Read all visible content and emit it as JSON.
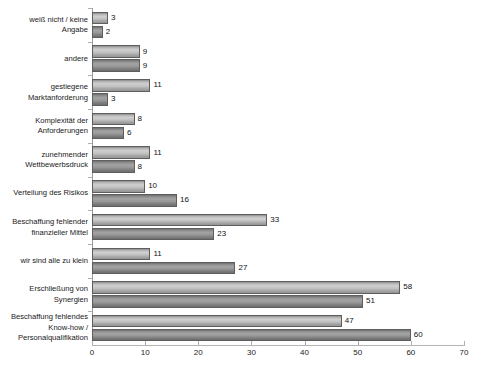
{
  "chart_data": {
    "type": "bar",
    "orientation": "horizontal",
    "title": "",
    "subtitle": "",
    "xlabel": "",
    "ylabel": "",
    "xlim": [
      0,
      70
    ],
    "xticks": [
      0,
      10,
      20,
      30,
      40,
      50,
      60,
      70
    ],
    "xtick_labels": [
      "0",
      "10",
      "20",
      "30",
      "40",
      "50",
      "60",
      "70"
    ],
    "grid": false,
    "legend": "none",
    "colors": {
      "series_0": "#c4c4c4",
      "series_1": "#8f8f8f",
      "bar_outline": "#5e5e5e",
      "axis": "#b0b0b0",
      "text": "#111111"
    },
    "categories": [
      "weiß nicht / keine\nAngabe",
      "andere",
      "gestiegene\nMarktanforderung",
      "Komplexität der\nAnforderungen",
      "zunehmender\nWettbewerbsdruck",
      "Verteilung des Risikos",
      "Beschaffung fehlender\nfinanzieller Mittel",
      "wir sind alle zu klein",
      "Erschließung von\nSynergien",
      "Beschaffung fehlendes\nKnow-how /\nPersonalqualifikation"
    ],
    "series": [
      {
        "name": "series_0",
        "values": [
          3,
          9,
          11,
          8,
          11,
          10,
          33,
          11,
          58,
          47
        ]
      },
      {
        "name": "series_1",
        "values": [
          2,
          9,
          3,
          6,
          8,
          16,
          23,
          27,
          51,
          60
        ]
      }
    ]
  }
}
